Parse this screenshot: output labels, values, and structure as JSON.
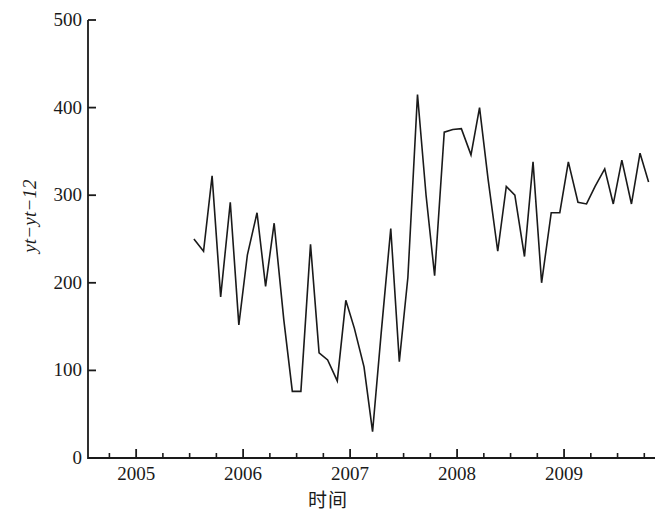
{
  "chart_data": {
    "type": "line",
    "title": "",
    "xlabel": "时间",
    "ylabel": "yt−yt−12",
    "ylim": [
      0,
      500
    ],
    "xlim": [
      2004.55,
      2009.85
    ],
    "grid": false,
    "legend": null,
    "y_ticks": [
      {
        "value": 500,
        "label": "500"
      },
      {
        "value": 400,
        "label": "400"
      },
      {
        "value": 300,
        "label": "300"
      },
      {
        "value": 200,
        "label": "200"
      },
      {
        "value": 100,
        "label": "100"
      },
      {
        "value": 0,
        "label": "0"
      }
    ],
    "x_ticks": [
      {
        "value": 2005,
        "label": "2005"
      },
      {
        "value": 2006,
        "label": "2006"
      },
      {
        "value": 2007,
        "label": "2007"
      },
      {
        "value": 2008,
        "label": "2008"
      },
      {
        "value": 2009,
        "label": "2009"
      }
    ],
    "x_minor_ticks": [
      2004.75,
      2005.25,
      2005.5,
      2005.75,
      2006.25,
      2006.5,
      2006.75,
      2007.25,
      2007.5,
      2007.75,
      2008.25,
      2008.5,
      2008.75,
      2009.25,
      2009.5,
      2009.75
    ],
    "line_color": "#1a1a1a",
    "line_width": 1.6,
    "series": [
      {
        "name": "yt-yt-12",
        "x": [
          2005.54,
          2005.63,
          2005.71,
          2005.79,
          2005.88,
          2005.96,
          2006.04,
          2006.13,
          2006.21,
          2006.29,
          2006.38,
          2006.46,
          2006.54,
          2006.63,
          2006.71,
          2006.79,
          2006.88,
          2006.96,
          2007.04,
          2007.13,
          2007.21,
          2007.29,
          2007.38,
          2007.46,
          2007.54,
          2007.63,
          2007.71,
          2007.79,
          2007.88,
          2007.96,
          2008.04,
          2008.13,
          2008.21,
          2008.29,
          2008.38,
          2008.46,
          2008.54,
          2008.63,
          2008.71,
          2008.79,
          2008.88,
          2008.96,
          2009.04,
          2009.13,
          2009.21,
          2009.29,
          2009.38,
          2009.46,
          2009.54,
          2009.63,
          2009.71,
          2009.79
        ],
        "values": [
          250,
          236,
          322,
          184,
          292,
          152,
          232,
          280,
          196,
          268,
          158,
          76,
          76,
          244,
          120,
          112,
          88,
          180,
          148,
          104,
          30,
          142,
          262,
          110,
          206,
          415,
          300,
          208,
          372,
          375,
          376,
          346,
          400,
          318,
          236,
          310,
          300,
          230,
          338,
          200,
          280,
          280,
          338,
          292,
          290,
          310,
          330,
          290,
          340,
          290,
          348,
          315
        ]
      }
    ]
  },
  "axes": {
    "y_axis_name": "y-axis",
    "x_axis_name": "x-axis"
  }
}
